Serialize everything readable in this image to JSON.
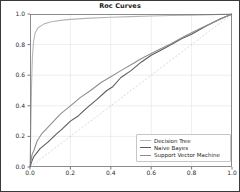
{
  "window": {
    "title": "Roc Curves"
  },
  "chart_data": {
    "type": "line",
    "title": "Roc Curves",
    "xlabel": "",
    "ylabel": "",
    "xlim": [
      0,
      1
    ],
    "ylim": [
      0,
      1
    ],
    "grid": true,
    "x_tick_labels": [
      "0.0",
      "0.2",
      "0.4",
      "0.6",
      "0.8",
      "1.0"
    ],
    "y_tick_labels": [
      "0.0",
      "0.2",
      "0.4",
      "0.6",
      "0.8",
      "1.0"
    ],
    "legend_position": "lower right",
    "colors": {
      "grid": "#e3e3e3",
      "spine": "#6e6e6e",
      "tick": "#555555",
      "reference": "#cfcfcf",
      "text": "#1a1a1a"
    },
    "reference_line": {
      "name": "chance-diagonal",
      "style": "dashed",
      "color": "#cfcfcf",
      "points": [
        [
          0,
          0
        ],
        [
          1,
          1
        ]
      ]
    },
    "series": [
      {
        "name": "Decision Tree",
        "color": "#b5b5b5",
        "points": [
          [
            0,
            0
          ],
          [
            0.004,
            0.25
          ],
          [
            0.008,
            0.55
          ],
          [
            0.012,
            0.72
          ],
          [
            0.018,
            0.82
          ],
          [
            0.025,
            0.875
          ],
          [
            0.04,
            0.91
          ],
          [
            0.07,
            0.935
          ],
          [
            0.1,
            0.948
          ],
          [
            0.15,
            0.958
          ],
          [
            0.2,
            0.965
          ],
          [
            0.3,
            0.973
          ],
          [
            0.4,
            0.979
          ],
          [
            0.5,
            0.983
          ],
          [
            0.6,
            0.987
          ],
          [
            0.7,
            0.99
          ],
          [
            0.8,
            0.992
          ],
          [
            0.9,
            0.996
          ],
          [
            1,
            1
          ]
        ]
      },
      {
        "name": "Naive Bayes",
        "color": "#5c5c5c",
        "points": [
          [
            0,
            0
          ],
          [
            0.01,
            0.04
          ],
          [
            0.02,
            0.07
          ],
          [
            0.05,
            0.12
          ],
          [
            0.09,
            0.165
          ],
          [
            0.13,
            0.215
          ],
          [
            0.16,
            0.25
          ],
          [
            0.2,
            0.3
          ],
          [
            0.24,
            0.335
          ],
          [
            0.28,
            0.385
          ],
          [
            0.33,
            0.44
          ],
          [
            0.38,
            0.5
          ],
          [
            0.41,
            0.525
          ],
          [
            0.45,
            0.585
          ],
          [
            0.5,
            0.63
          ],
          [
            0.55,
            0.685
          ],
          [
            0.6,
            0.73
          ],
          [
            0.65,
            0.765
          ],
          [
            0.7,
            0.8
          ],
          [
            0.75,
            0.838
          ],
          [
            0.8,
            0.868
          ],
          [
            0.87,
            0.92
          ],
          [
            0.94,
            0.968
          ],
          [
            1,
            1
          ]
        ]
      },
      {
        "name": "Support Vector Machine",
        "color": "#8f8f8f",
        "points": [
          [
            0,
            0
          ],
          [
            0.01,
            0.08
          ],
          [
            0.02,
            0.11
          ],
          [
            0.035,
            0.17
          ],
          [
            0.06,
            0.22
          ],
          [
            0.1,
            0.275
          ],
          [
            0.15,
            0.345
          ],
          [
            0.2,
            0.4
          ],
          [
            0.25,
            0.455
          ],
          [
            0.3,
            0.5
          ],
          [
            0.35,
            0.55
          ],
          [
            0.4,
            0.59
          ],
          [
            0.45,
            0.63
          ],
          [
            0.5,
            0.668
          ],
          [
            0.55,
            0.708
          ],
          [
            0.6,
            0.742
          ],
          [
            0.65,
            0.775
          ],
          [
            0.7,
            0.808
          ],
          [
            0.77,
            0.858
          ],
          [
            0.85,
            0.91
          ],
          [
            0.92,
            0.952
          ],
          [
            1,
            1
          ]
        ]
      }
    ]
  }
}
